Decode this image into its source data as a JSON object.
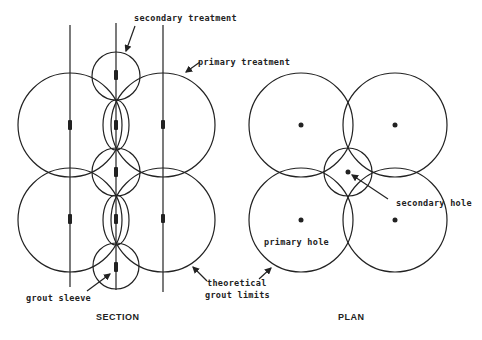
{
  "diagram": {
    "section": {
      "title": "SECTION",
      "labels": {
        "secondary_treatment": "secondary treatment",
        "primary_treatment": "primary treatment",
        "grout_sleeve": "grout sleeve"
      }
    },
    "plan": {
      "title": "PLAN",
      "labels": {
        "secondary_hole": "secondary hole",
        "primary_hole": "primary hole"
      }
    },
    "shared_labels": {
      "theoretical_line1": "theoretical",
      "theoretical_line2": "grout limits"
    },
    "colors": {
      "line": "#222222",
      "background": "#ffffff"
    }
  }
}
